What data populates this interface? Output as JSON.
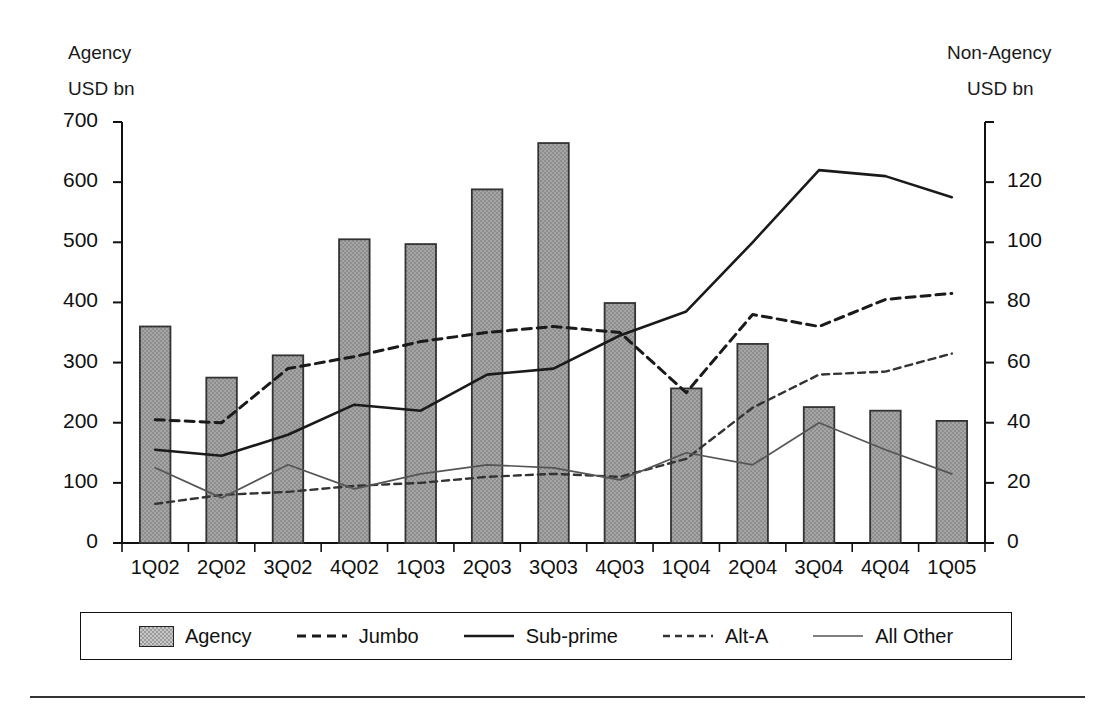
{
  "axes": {
    "left_title_line1": "Agency",
    "left_title_line2": "USD bn",
    "right_title_line1": "Non-Agency",
    "right_title_line2": "USD bn",
    "left_ticks": [
      "700",
      "600",
      "500",
      "400",
      "300",
      "200",
      "100",
      "0"
    ],
    "right_ticks": [
      "",
      "120",
      "100",
      "80",
      "60",
      "40",
      "20",
      "0"
    ]
  },
  "legend": {
    "items": [
      {
        "label": "Agency",
        "style": "bar",
        "color": "#9a9a9a"
      },
      {
        "label": "Jumbo",
        "style": "dashed",
        "color": "#1a1a1a"
      },
      {
        "label": "Sub-prime",
        "style": "solid-thick",
        "color": "#1a1a1a"
      },
      {
        "label": "Alt-A",
        "style": "fine-dashed",
        "color": "#333333"
      },
      {
        "label": "All Other",
        "style": "solid-thin",
        "color": "#555555"
      }
    ]
  },
  "chart_data": {
    "type": "bar",
    "title": "",
    "xlabel": "",
    "ylabel": "Agency USD bn",
    "y2label": "Non-Agency USD bn",
    "ylim": [
      0,
      700
    ],
    "y2lim": [
      0,
      140
    ],
    "grid": false,
    "legend_position": "bottom",
    "categories": [
      "1Q02",
      "2Q02",
      "3Q02",
      "4Q02",
      "1Q03",
      "2Q03",
      "3Q03",
      "4Q03",
      "1Q04",
      "2Q04",
      "3Q04",
      "4Q04",
      "1Q05"
    ],
    "series": [
      {
        "name": "Agency",
        "axis": "left",
        "type": "bar",
        "color": "#9a9a9a",
        "values": [
          360,
          275,
          312,
          505,
          497,
          588,
          665,
          399,
          257,
          331,
          226,
          220,
          203
        ]
      },
      {
        "name": "Jumbo",
        "axis": "right",
        "type": "line",
        "style": "dashed",
        "color": "#1a1a1a",
        "values": [
          41,
          40,
          58,
          62,
          67,
          70,
          72,
          70,
          50,
          76,
          72,
          81,
          83
        ]
      },
      {
        "name": "Sub-prime",
        "axis": "right",
        "type": "line",
        "style": "solid-thick",
        "color": "#1a1a1a",
        "values": [
          31,
          29,
          36,
          46,
          44,
          56,
          58,
          69,
          77,
          100,
          124,
          122,
          115
        ]
      },
      {
        "name": "Alt-A",
        "axis": "right",
        "type": "line",
        "style": "fine-dashed",
        "color": "#333333",
        "values": [
          13,
          16,
          17,
          19,
          20,
          22,
          23,
          22,
          28,
          45,
          56,
          57,
          63
        ]
      },
      {
        "name": "All Other",
        "axis": "right",
        "type": "line",
        "style": "solid-thin",
        "color": "#555555",
        "values": [
          25,
          15,
          26,
          18,
          23,
          26,
          25,
          21,
          30,
          26,
          40,
          31,
          23
        ]
      }
    ]
  }
}
